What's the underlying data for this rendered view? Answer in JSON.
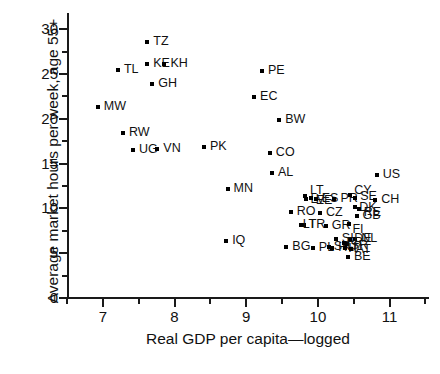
{
  "chart_data": {
    "type": "scatter",
    "title": "",
    "xlabel": "Real GDP per capita—logged",
    "ylabel": "Average market hours per week, age 55+",
    "xlim": [
      6.5,
      11.55
    ],
    "ylim": [
      0,
      31.8
    ],
    "xticks": [
      7,
      8,
      9,
      10,
      11
    ],
    "yticks": [
      0,
      5,
      10,
      15,
      20,
      25,
      30
    ],
    "xtick_labels": [
      "7",
      "8",
      "9",
      "10",
      "11"
    ],
    "ytick_labels": [
      "0",
      "5",
      "10",
      "15",
      "20",
      "25",
      "30"
    ],
    "grid": false,
    "legend": false,
    "marker": "square",
    "marker_color": "#000000",
    "points": [
      {
        "label": "TZ",
        "x": 7.62,
        "y": 28.6,
        "lx": 6,
        "ly": -5
      },
      {
        "label": "KE",
        "x": 7.62,
        "y": 26.1,
        "lx": 6,
        "ly": -5
      },
      {
        "label": "KH",
        "x": 7.86,
        "y": 26.1,
        "lx": 6,
        "ly": -5
      },
      {
        "label": "TL",
        "x": 7.21,
        "y": 25.4,
        "lx": 6,
        "ly": -5
      },
      {
        "label": "GH",
        "x": 7.69,
        "y": 23.9,
        "lx": 6,
        "ly": -5
      },
      {
        "label": "MW",
        "x": 6.93,
        "y": 21.3,
        "lx": 6,
        "ly": -5
      },
      {
        "label": "RW",
        "x": 7.28,
        "y": 18.4,
        "lx": 6,
        "ly": -5
      },
      {
        "label": "UG",
        "x": 7.42,
        "y": 16.5,
        "lx": 6,
        "ly": -5
      },
      {
        "label": "VN",
        "x": 7.76,
        "y": 16.6,
        "lx": 6,
        "ly": -5
      },
      {
        "label": "PK",
        "x": 8.41,
        "y": 16.9,
        "lx": 6,
        "ly": -5
      },
      {
        "label": "PE",
        "x": 9.22,
        "y": 25.3,
        "lx": 6,
        "ly": -5
      },
      {
        "label": "EC",
        "x": 9.11,
        "y": 22.4,
        "lx": 6,
        "ly": -5
      },
      {
        "label": "BW",
        "x": 9.46,
        "y": 19.9,
        "lx": 6,
        "ly": -5
      },
      {
        "label": "CO",
        "x": 9.33,
        "y": 16.2,
        "lx": 6,
        "ly": -5
      },
      {
        "label": "AL",
        "x": 9.36,
        "y": 13.9,
        "lx": 6,
        "ly": -5
      },
      {
        "label": "MN",
        "x": 8.74,
        "y": 12.2,
        "lx": 6,
        "ly": -5
      },
      {
        "label": "US",
        "x": 10.82,
        "y": 13.7,
        "lx": 6,
        "ly": -5
      },
      {
        "label": "RO",
        "x": 9.62,
        "y": 9.6,
        "lx": 6,
        "ly": -5
      },
      {
        "label": "IQ",
        "x": 8.72,
        "y": 6.4,
        "lx": 6,
        "ly": -5
      },
      {
        "label": "BG",
        "x": 9.56,
        "y": 5.7,
        "lx": 6,
        "ly": -5
      },
      {
        "label": "PL",
        "x": 9.93,
        "y": 5.6,
        "lx": 6,
        "ly": -5
      },
      {
        "label": "SK",
        "x": 10.15,
        "y": 5.7,
        "lx": 5,
        "ly": -5
      },
      {
        "label": "HU",
        "x": 10.2,
        "y": 5.6,
        "lx": 6,
        "ly": -5
      },
      {
        "label": "LV",
        "x": 9.84,
        "y": 11.0,
        "lx": 4,
        "ly": -4
      },
      {
        "label": "LT",
        "x": 9.82,
        "y": 11.4,
        "lx": 5,
        "ly": -10
      },
      {
        "label": "EE",
        "x": 9.9,
        "y": 11.2,
        "lx": 5,
        "ly": -2
      },
      {
        "label": "ES",
        "x": 9.97,
        "y": 11.1,
        "lx": 6,
        "ly": -5
      },
      {
        "label": "PR",
        "x": 10.23,
        "y": 11.1,
        "lx": 6,
        "ly": -5
      },
      {
        "label": "CY",
        "x": 10.45,
        "y": 11.5,
        "lx": 4,
        "ly": -9
      },
      {
        "label": "SE",
        "x": 10.52,
        "y": 11.2,
        "lx": 5,
        "ly": -6
      },
      {
        "label": "CH",
        "x": 10.8,
        "y": 10.9,
        "lx": 6,
        "ly": -5
      },
      {
        "label": "CZ",
        "x": 10.03,
        "y": 9.5,
        "lx": 6,
        "ly": -5
      },
      {
        "label": "DK",
        "x": 10.52,
        "y": 10.2,
        "lx": 4,
        "ly": -4
      },
      {
        "label": "RE",
        "x": 10.57,
        "y": 9.9,
        "lx": 5,
        "ly": -1
      },
      {
        "label": "GB",
        "x": 10.54,
        "y": 9.1,
        "lx": 6,
        "ly": -5
      },
      {
        "label": "TR",
        "x": 9.8,
        "y": 8.2,
        "lx": 5,
        "ly": -5
      },
      {
        "label": "LT2",
        "x": 9.76,
        "y": 8.2,
        "lx": 2,
        "ly": -5
      },
      {
        "label": "GR",
        "x": 10.11,
        "y": 8.0,
        "lx": 6,
        "ly": -5
      },
      {
        "label": "FI",
        "x": 10.44,
        "y": 8.3,
        "lx": 3,
        "ly": 1
      },
      {
        "label": "SI",
        "x": 10.25,
        "y": 6.6,
        "lx": 6,
        "ly": -5
      },
      {
        "label": "NL",
        "x": 10.52,
        "y": 6.6,
        "lx": 6,
        "ly": -5
      },
      {
        "label": "DE",
        "x": 10.45,
        "y": 6.6,
        "lx": 4,
        "ly": -5
      },
      {
        "label": "SR",
        "x": 10.4,
        "y": 6.0,
        "lx": 4,
        "ly": -3
      },
      {
        "label": "FR",
        "x": 10.37,
        "y": 6.1,
        "lx": 2,
        "ly": -5
      },
      {
        "label": "IT",
        "x": 10.38,
        "y": 5.6,
        "lx": 3,
        "ly": -4
      },
      {
        "label": "AT",
        "x": 10.46,
        "y": 5.5,
        "lx": 5,
        "ly": -4
      },
      {
        "label": "BE",
        "x": 10.42,
        "y": 4.6,
        "lx": 6,
        "ly": -5
      }
    ]
  },
  "axes": {
    "x_title": "Real GDP per capita—logged",
    "y_title": "Average market hours per week, age 55+"
  }
}
